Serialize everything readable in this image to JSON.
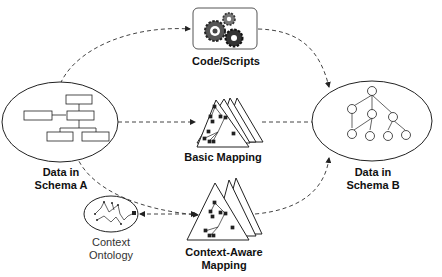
{
  "nodes": {
    "schema_a": {
      "label_line1": "Data in",
      "label_line2": "Schema A"
    },
    "schema_b": {
      "label_line1": "Data in",
      "label_line2": "Schema B"
    },
    "code_scripts": {
      "label": "Code/Scripts",
      "icon": "gears-icon"
    },
    "basic_mapping": {
      "label": "Basic Mapping",
      "icon": "stacked-triangle-graph-icon"
    },
    "context_aware_mapping": {
      "label_line1": "Context-Aware",
      "label_line2": "Mapping",
      "icon": "stacked-triangle-graph-icon"
    },
    "context_ontology": {
      "label_line1": "Context",
      "label_line2": "Ontology",
      "icon": "ontology-graph-icon"
    }
  },
  "edges": [
    {
      "from": "schema_a",
      "to": "code_scripts",
      "style": "dashed",
      "arrow": "end"
    },
    {
      "from": "code_scripts",
      "to": "schema_b",
      "style": "dashed",
      "arrow": "end"
    },
    {
      "from": "schema_a",
      "to": "basic_mapping",
      "style": "dashed",
      "arrow": "end"
    },
    {
      "from": "basic_mapping",
      "to": "schema_b",
      "style": "dashed",
      "arrow": "end"
    },
    {
      "from": "schema_a",
      "to": "context_aware_mapping",
      "style": "dashed",
      "arrow": "end"
    },
    {
      "from": "context_aware_mapping",
      "to": "schema_b",
      "style": "dashed",
      "arrow": "end"
    },
    {
      "from": "context_ontology",
      "to": "context_aware_mapping",
      "style": "dashed",
      "arrow": "both"
    }
  ],
  "colors": {
    "stroke": "#222222",
    "dash": "#444444",
    "background": "#ffffff"
  }
}
